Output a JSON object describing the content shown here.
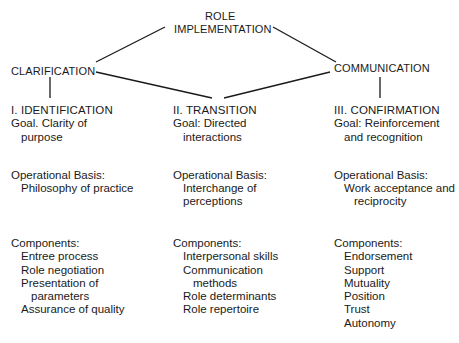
{
  "diagram": {
    "top_node": {
      "line1": "ROLE",
      "line2": "IMPLEMENTATION"
    },
    "left_node": "CLARIFICATION",
    "right_node": "COMMUNICATION",
    "columns": [
      {
        "heading": "I.  IDENTIFICATION",
        "goal": [
          "Goal. Clarity of",
          "purpose"
        ],
        "basis_label": "Operational Basis:",
        "basis": [
          "Philosophy of practice"
        ],
        "components_label": "Components:",
        "components": [
          {
            "text": "Entree process",
            "indent": 1
          },
          {
            "text": "Role negotiation",
            "indent": 1
          },
          {
            "text": "Presentation of",
            "indent": 1
          },
          {
            "text": "parameters",
            "indent": 2
          },
          {
            "text": "Assurance of quality",
            "indent": 1
          }
        ]
      },
      {
        "heading": "II.  TRANSITION",
        "goal": [
          "Goal:  Directed",
          "interactions"
        ],
        "basis_label": "Operational Basis:",
        "basis": [
          "Interchange of",
          "perceptions"
        ],
        "components_label": "Components:",
        "components": [
          {
            "text": "Interpersonal skills",
            "indent": 1
          },
          {
            "text": "Communication",
            "indent": 1
          },
          {
            "text": "methods",
            "indent": 2
          },
          {
            "text": "Role determinants",
            "indent": 1
          },
          {
            "text": "Role repertoire",
            "indent": 1
          }
        ]
      },
      {
        "heading": "III.  CONFIRMATION",
        "goal": [
          "Goal: Reinforcement",
          "and recognition"
        ],
        "basis_label": "Operational Basis:",
        "basis": [
          "Work acceptance and",
          "reciprocity"
        ],
        "components_label": "Components:",
        "components": [
          {
            "text": "Endorsement",
            "indent": 1
          },
          {
            "text": "Support",
            "indent": 1
          },
          {
            "text": "Mutuality",
            "indent": 1
          },
          {
            "text": "Position",
            "indent": 1
          },
          {
            "text": "Trust",
            "indent": 1
          },
          {
            "text": "Autonomy",
            "indent": 1
          }
        ]
      }
    ]
  }
}
